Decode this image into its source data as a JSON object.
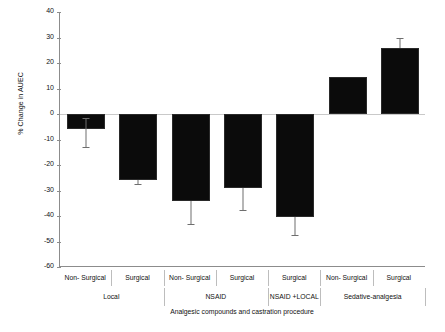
{
  "chart_data": {
    "type": "bar",
    "title": "",
    "xlabel": "Analgesic compounds and castration procedure",
    "ylabel": "% Change in AUEC",
    "ylim": [
      -60,
      40
    ],
    "yticks": [
      40,
      30,
      20,
      10,
      0,
      -10,
      -20,
      -30,
      -40,
      -50,
      -60
    ],
    "ytick_labels": [
      "40",
      "30",
      "20",
      "10",
      "0",
      "-10",
      "-20",
      "-30",
      "-40",
      "-50",
      "-60"
    ],
    "grid": false,
    "legend": "none",
    "bar_color": "#0b0b0b",
    "error_color": "#6e6e6e",
    "axis_color": "#8c8c8c",
    "categories": [
      "Non- Surgical",
      "Surgical",
      "Non- Surgical",
      "Surgical",
      "Surgical",
      "Non- Surgical",
      "Surgical"
    ],
    "groups": [
      {
        "label": "Local",
        "span": 2
      },
      {
        "label": "NSAID",
        "span": 2
      },
      {
        "label": "NSAID +LOCAL",
        "span": 1
      },
      {
        "label": "Sedative-analgesia",
        "span": 2
      }
    ],
    "values": [
      -6,
      -25.8,
      -34,
      -29,
      -40.5,
      14.5,
      26
    ],
    "err_low": [
      -13,
      -27.5,
      -43,
      -37.5,
      -47.5,
      14.5,
      26
    ],
    "err_high": [
      -1.5,
      -25.8,
      -34,
      -29,
      -40.5,
      14.5,
      30
    ],
    "series": [
      {
        "name": "% Change in AUEC",
        "values": [
          -6,
          -25.8,
          -34,
          -29,
          -40.5,
          14.5,
          26
        ]
      }
    ]
  }
}
